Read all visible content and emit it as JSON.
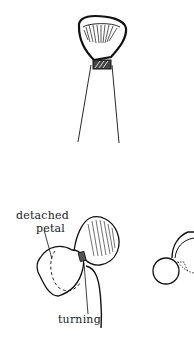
{
  "diagram": {
    "labels": {
      "detached_petal_line1": "detached",
      "detached_petal_line2": "petal",
      "turning": "turning"
    },
    "colors": {
      "ink": "#111111",
      "background": "#ffffff"
    }
  }
}
